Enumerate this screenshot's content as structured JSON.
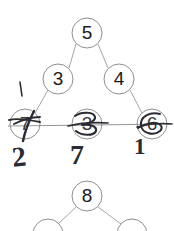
{
  "document": {
    "kind": "handwritten-annotated-graph-worksheet",
    "background_color": "#ffffff",
    "ink_color": "#2b2b33",
    "printed_line_color": "#8a8a8a",
    "printed_text_color": "#1a1a1a"
  },
  "diagram_top": {
    "name": "triangle-graph",
    "nodes": [
      {
        "id": "n5",
        "label": "5",
        "cx": 87,
        "cy": 33,
        "r": 15
      },
      {
        "id": "n3",
        "label": "3",
        "cx": 58,
        "cy": 79,
        "r": 15
      },
      {
        "id": "n4",
        "label": "4",
        "cx": 119,
        "cy": 79,
        "r": 15
      },
      {
        "id": "n7",
        "label": "7",
        "cx": 25,
        "cy": 124,
        "r": 15
      },
      {
        "id": "n3b",
        "label": "3",
        "cx": 87,
        "cy": 124,
        "r": 15
      },
      {
        "id": "n6",
        "label": "6",
        "cx": 152,
        "cy": 124,
        "r": 15
      }
    ],
    "edges": [
      {
        "from": "n5",
        "to": "n3"
      },
      {
        "from": "n5",
        "to": "n4"
      },
      {
        "from": "n3",
        "to": "n7"
      },
      {
        "from": "n4",
        "to": "n6"
      },
      {
        "from": "n7",
        "to": "n3b"
      },
      {
        "from": "n3b",
        "to": "n6"
      }
    ]
  },
  "annotations": {
    "name": "handwritten-pen-marks",
    "tick_mark": {
      "label": "1",
      "x": 20,
      "y": 82
    },
    "struck_nodes": [
      "n7",
      "n3b",
      "n6"
    ],
    "below_labels": [
      {
        "label": "2",
        "x": 16,
        "y": 148
      },
      {
        "label": "7",
        "x": 74,
        "y": 146
      },
      {
        "label": "1",
        "x": 136,
        "y": 140
      }
    ]
  },
  "diagram_bottom": {
    "name": "partial-tree-graph",
    "nodes": [
      {
        "id": "m8",
        "label": "8",
        "cx": 87,
        "cy": 196,
        "r": 15
      },
      {
        "id": "m_left",
        "label": "",
        "cx": 48,
        "cy": 232,
        "r": 15
      },
      {
        "id": "m_right",
        "label": "",
        "cx": 132,
        "cy": 232,
        "r": 15
      }
    ],
    "edges": [
      {
        "from": "m8",
        "to": "m_left"
      },
      {
        "from": "m8",
        "to": "m_right"
      }
    ]
  }
}
